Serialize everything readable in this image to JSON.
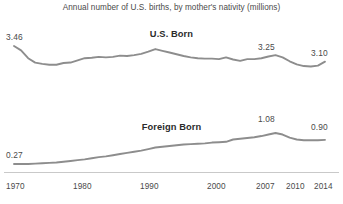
{
  "chart_data": {
    "type": "line",
    "title": "Annual number of U.S. births, by mother's nativity (millions)",
    "xlabel": "",
    "ylabel": "",
    "grid": false,
    "legend_position": "inline-series-labels",
    "xlim": [
      1970,
      2014
    ],
    "ylim": [
      0,
      3.6
    ],
    "tick_labels": [
      "1970",
      "1980",
      "1990",
      "2000",
      "2007",
      "2010",
      "2014"
    ],
    "tick_values": [
      1970,
      1980,
      1990,
      2000,
      2007,
      2010,
      2014
    ],
    "series": [
      {
        "name": "U.S. Born",
        "x": [
          1970,
          1971,
          1972,
          1973,
          1974,
          1975,
          1976,
          1977,
          1978,
          1979,
          1980,
          1981,
          1982,
          1983,
          1984,
          1985,
          1986,
          1987,
          1988,
          1989,
          1990,
          1991,
          1992,
          1993,
          1994,
          1995,
          1996,
          1997,
          1998,
          1999,
          2000,
          2001,
          2002,
          2003,
          2004,
          2005,
          2006,
          2007,
          2008,
          2009,
          2010,
          2011,
          2012,
          2013,
          2014
        ],
        "values": [
          3.46,
          3.36,
          3.18,
          3.08,
          3.05,
          3.03,
          3.03,
          3.07,
          3.08,
          3.13,
          3.18,
          3.19,
          3.21,
          3.2,
          3.21,
          3.24,
          3.23,
          3.25,
          3.28,
          3.33,
          3.39,
          3.35,
          3.31,
          3.27,
          3.23,
          3.2,
          3.18,
          3.17,
          3.17,
          3.16,
          3.2,
          3.15,
          3.12,
          3.16,
          3.16,
          3.18,
          3.22,
          3.25,
          3.2,
          3.11,
          3.04,
          3.0,
          2.99,
          3.01,
          3.1
        ],
        "labeled_points": [
          {
            "x": 1970,
            "value": "3.46"
          },
          {
            "x": 2007,
            "value": "3.25"
          },
          {
            "x": 2014,
            "value": "3.10"
          }
        ],
        "color": "#8d8d8d"
      },
      {
        "name": "Foreign Born",
        "x": [
          1970,
          1971,
          1972,
          1973,
          1974,
          1975,
          1976,
          1977,
          1978,
          1979,
          1980,
          1981,
          1982,
          1983,
          1984,
          1985,
          1986,
          1987,
          1988,
          1989,
          1990,
          1991,
          1992,
          1993,
          1994,
          1995,
          1996,
          1997,
          1998,
          1999,
          2000,
          2001,
          2002,
          2003,
          2004,
          2005,
          2006,
          2007,
          2008,
          2009,
          2010,
          2011,
          2012,
          2013,
          2014
        ],
        "values": [
          0.27,
          0.27,
          0.27,
          0.28,
          0.29,
          0.3,
          0.31,
          0.33,
          0.35,
          0.37,
          0.39,
          0.42,
          0.45,
          0.47,
          0.5,
          0.53,
          0.56,
          0.59,
          0.62,
          0.66,
          0.7,
          0.72,
          0.74,
          0.76,
          0.78,
          0.79,
          0.8,
          0.81,
          0.83,
          0.84,
          0.85,
          0.91,
          0.93,
          0.95,
          0.97,
          1.0,
          1.04,
          1.08,
          1.04,
          0.96,
          0.91,
          0.89,
          0.89,
          0.89,
          0.9
        ],
        "labeled_points": [
          {
            "x": 1970,
            "value": "0.27"
          },
          {
            "x": 2007,
            "value": "1.08"
          },
          {
            "x": 2014,
            "value": "0.90"
          }
        ],
        "color": "#8d8d8d"
      }
    ]
  },
  "title": {
    "text": "Annual number of U.S. births, by mother's nativity (millions)"
  },
  "series_labels": {
    "us_born": "U.S. Born",
    "foreign_born": "Foreign Born"
  },
  "value_labels": {
    "us_start": "3.46",
    "us_2007": "3.25",
    "us_end": "3.10",
    "foreign_start": "0.27",
    "foreign_2007": "1.08",
    "foreign_end": "0.90"
  },
  "axis": {
    "ticks": [
      "1970",
      "1980",
      "1990",
      "2000",
      "2007",
      "2010",
      "2014"
    ]
  },
  "colors": {
    "line": "#8d8d8d",
    "text": "#4a4a4a",
    "axis": "#c9c9c9"
  }
}
